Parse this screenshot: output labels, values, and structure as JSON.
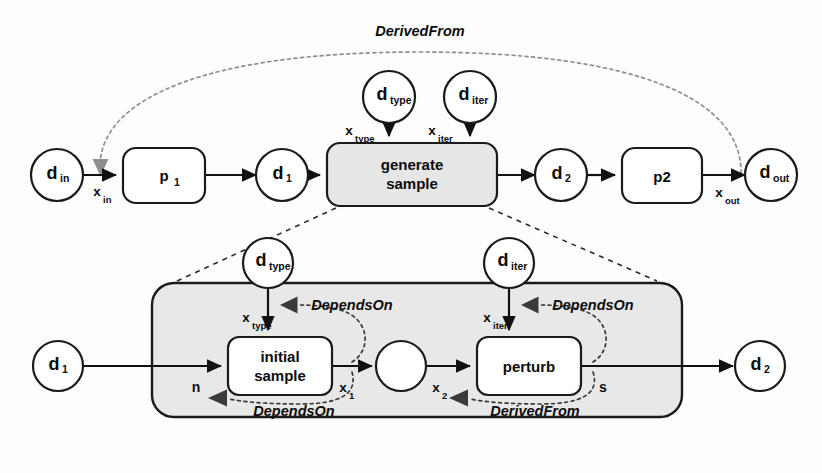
{
  "diagram": {
    "colors": {
      "box_fill_white": "#ffffff",
      "box_fill_gray": "#e6e6e6",
      "container_fill": "#e8e8e8",
      "stroke": "#1a1a1a",
      "gray_arrow": "#8e8e8e",
      "background": "#fdfdfd"
    },
    "top_level": {
      "data_nodes": [
        {
          "id": "d_in",
          "base": "d",
          "sub": "in",
          "cx": 57,
          "cy": 175
        },
        {
          "id": "d_1",
          "base": "d",
          "sub": "1",
          "cx": 282,
          "cy": 175
        },
        {
          "id": "d_type",
          "base": "d",
          "sub": "type",
          "cx": 389,
          "cy": 97
        },
        {
          "id": "d_iter",
          "base": "d",
          "sub": "iter",
          "cx": 470,
          "cy": 97
        },
        {
          "id": "d_2",
          "base": "d",
          "sub": "2",
          "cx": 561,
          "cy": 175
        },
        {
          "id": "d_out",
          "base": "d",
          "sub": "out",
          "cx": 771,
          "cy": 175
        }
      ],
      "processes": [
        {
          "id": "p_1",
          "label": "p",
          "sub": "1",
          "lines": [
            "p"
          ],
          "x": 123,
          "y": 148,
          "w": 82,
          "h": 55,
          "fill": "white"
        },
        {
          "id": "generate_sample",
          "label": "generate sample",
          "sub": "",
          "lines": [
            "generate",
            "sample"
          ],
          "x": 327,
          "y": 143,
          "w": 170,
          "h": 63,
          "fill": "gray"
        },
        {
          "id": "p2",
          "label": "p2",
          "sub": "",
          "lines": [
            "p2"
          ],
          "x": 622,
          "y": 148,
          "w": 80,
          "h": 55,
          "fill": "white"
        }
      ],
      "port_labels": [
        {
          "id": "x_in",
          "base": "x",
          "sub": "in",
          "x": 100,
          "y": 192
        },
        {
          "id": "x_type",
          "base": "x",
          "sub": "type",
          "x": 355,
          "y": 131
        },
        {
          "id": "x_iter",
          "base": "x",
          "sub": "iter",
          "x": 438,
          "y": 131
        },
        {
          "id": "x_out",
          "base": "x",
          "sub": "out",
          "x": 723,
          "y": 193
        }
      ],
      "relations": [
        {
          "id": "derived-from-top",
          "label": "DerivedFrom",
          "x": 420,
          "y": 36
        }
      ]
    },
    "detail_level": {
      "container": {
        "id": "generate-sample-expansion",
        "x": 152,
        "y": 283,
        "w": 530,
        "h": 134
      },
      "data_nodes": [
        {
          "id": "inner_d_1",
          "base": "d",
          "sub": "1",
          "cx": 58,
          "cy": 366
        },
        {
          "id": "inner_d_type",
          "base": "d",
          "sub": "type",
          "cx": 268,
          "cy": 263
        },
        {
          "id": "inner_d_iter",
          "base": "d",
          "sub": "iter",
          "cx": 509,
          "cy": 263
        },
        {
          "id": "inner_d_2",
          "base": "d",
          "sub": "2",
          "cx": 760,
          "cy": 366
        },
        {
          "id": "intermediate",
          "base": "",
          "sub": "",
          "cx": 401,
          "cy": 366
        }
      ],
      "processes": [
        {
          "id": "initial_sample",
          "lines": [
            "initial",
            "sample"
          ],
          "x": 228,
          "y": 337,
          "w": 104,
          "h": 58,
          "fill": "white"
        },
        {
          "id": "perturb",
          "lines": [
            "perturb"
          ],
          "x": 477,
          "y": 337,
          "w": 104,
          "h": 58,
          "fill": "white"
        }
      ],
      "port_labels": [
        {
          "id": "inner_x_type",
          "base": "x",
          "sub": "type",
          "x": 252,
          "y": 318
        },
        {
          "id": "inner_x_iter",
          "base": "x",
          "sub": "iter",
          "x": 493,
          "y": 318
        },
        {
          "id": "n",
          "base": "n",
          "sub": "",
          "x": 196,
          "y": 388
        },
        {
          "id": "x_1",
          "base": "x",
          "sub": "1",
          "x": 347,
          "y": 388
        },
        {
          "id": "x_2",
          "base": "x",
          "sub": "2",
          "x": 440,
          "y": 388
        },
        {
          "id": "s",
          "base": "s",
          "sub": "",
          "x": 603,
          "y": 388
        }
      ],
      "relations": [
        {
          "id": "depends-on-left-top",
          "label": "DependsOn",
          "x": 347,
          "y": 307
        },
        {
          "id": "depends-on-right-top",
          "label": "DependsOn",
          "x": 588,
          "y": 307
        },
        {
          "id": "depends-on-bottom",
          "label": "DependsOn",
          "x": 294,
          "y": 411
        },
        {
          "id": "derived-from-bottom",
          "label": "DerivedFrom",
          "x": 535,
          "y": 411
        }
      ]
    }
  }
}
